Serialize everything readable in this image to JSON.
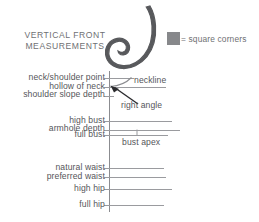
{
  "canvas": {
    "width": 259,
    "height": 222,
    "background": "#ffffff"
  },
  "clipped_top_text": "",
  "title": {
    "line1": "VERTICAL FRONT",
    "line2": "MEASUREMENTS",
    "color": "#6f7073"
  },
  "legend": {
    "swatch_icon": "filled-square-icon",
    "swatch_color": "#87888b",
    "text": "= square corners"
  },
  "graphic": {
    "hook_icon": "spiral-hook-shape",
    "hook_color": "#58595c"
  },
  "axis": {
    "orientation": "vertical",
    "color": "#8b8c90",
    "x": 109,
    "top": 71,
    "bottom": 212
  },
  "measurements": [
    {
      "label": "neck/shoulder point",
      "y": 78,
      "tick_width": 30,
      "tick_color": "#9a9b9f"
    },
    {
      "label": "hollow of neck",
      "y": 87,
      "tick_width": 62,
      "tick_color": "#9a9b9f"
    },
    {
      "label": "shoulder slope depth",
      "y": 95.5,
      "tick_width": 10,
      "tick_color": "#9a9b9f"
    },
    {
      "label": "high bust",
      "y": 121,
      "tick_width": 68,
      "tick_color": "#9a9b9f"
    },
    {
      "label": "armhole depth",
      "y": 129.5,
      "tick_width": 76,
      "tick_color": "#9a9b9f"
    },
    {
      "label": "full bust",
      "y": 135,
      "tick_width": 64,
      "tick_color": "#9a9b9f"
    },
    {
      "label": "natural waist",
      "y": 168,
      "tick_width": 60,
      "tick_color": "#9a9b9f"
    },
    {
      "label": "preferred waist",
      "y": 177,
      "tick_width": 62,
      "tick_color": "#9a9b9f"
    },
    {
      "label": "high hip",
      "y": 189,
      "tick_width": 68,
      "tick_color": "#9a9b9f"
    },
    {
      "label": "full hip",
      "y": 205,
      "tick_width": 60,
      "tick_color": "#9a9b9f"
    }
  ],
  "annotations": {
    "neckline": "neckline",
    "right_angle": "right angle",
    "bust_apex": "bust apex"
  },
  "arrow": {
    "name": "right-angle-pointer-arrow",
    "color": "#2b2b2e",
    "from_x": 138,
    "from_y": 104,
    "to_x": 112,
    "to_y": 86
  }
}
